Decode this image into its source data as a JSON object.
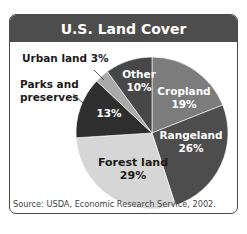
{
  "title": "U.S. Land Cover",
  "source": "Source: USDA, Economic Research Service, 2002.",
  "slices": [
    {
      "name": "Cropland",
      "pct_label": "19%",
      "color": "#7c7c7c"
    },
    {
      "name": "Rangeland",
      "pct_label": "26%",
      "color": "#4d4d4d"
    },
    {
      "name": "Forest land",
      "pct_label": "29%",
      "color": "#d6d6d6"
    },
    {
      "name": "Parks and preserves",
      "pct_label": "13%",
      "color": "#2e2e2e"
    },
    {
      "name": "Urban land",
      "pct_label": "3%",
      "color": "#a9a9a9"
    },
    {
      "name": "Other",
      "pct_label": "10%",
      "color": "#474747"
    }
  ],
  "labels": {
    "urban": "Urban land 3%",
    "parks_line1": "Parks and",
    "parks_line2": "preserves",
    "parks_pct": "13%",
    "other_name": "Other",
    "other_pct": "10%",
    "cropland_name": "Cropland",
    "cropland_pct": "19%",
    "rangeland_name": "Rangeland",
    "rangeland_pct": "26%",
    "forest_name": "Forest land",
    "forest_pct": "29%"
  },
  "chart_data": {
    "type": "pie",
    "title": "U.S. Land Cover",
    "categories": [
      "Cropland",
      "Rangeland",
      "Forest land",
      "Parks and preserves",
      "Urban land",
      "Other"
    ],
    "values": [
      19,
      26,
      29,
      13,
      3,
      10
    ],
    "units": "%",
    "start_angle": "12 o'clock",
    "direction": "clockwise",
    "legend": "none (direct labels)",
    "source": "Source: USDA, Economic Research Service, 2002."
  }
}
